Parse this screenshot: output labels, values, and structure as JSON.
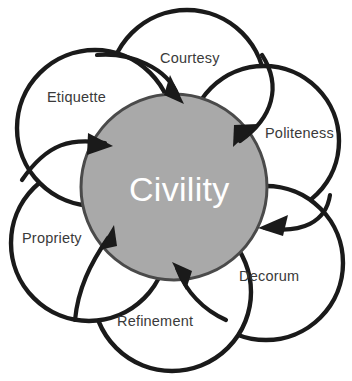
{
  "diagram": {
    "type": "petal-venn",
    "core": {
      "label": "Civility",
      "fill_color": "#a9a9a9",
      "stroke_color": "#4a4a4a",
      "text_color": "#ffffff",
      "center": [
        174,
        187
      ],
      "radius": 94
    },
    "petals": [
      {
        "id": "courtesy",
        "label": "Courtesy",
        "position": "top",
        "center": [
          187,
          88
        ],
        "radius": 78,
        "label_xy": [
          160,
          51
        ]
      },
      {
        "id": "politeness",
        "label": "Politeness",
        "position": "upper-right",
        "center": [
          264,
          141
        ],
        "radius": 75,
        "label_xy": [
          265,
          126
        ]
      },
      {
        "id": "decorum",
        "label": "Decorum",
        "position": "lower-right",
        "center": [
          266,
          263
        ],
        "radius": 77,
        "label_xy": [
          239,
          269
        ]
      },
      {
        "id": "refinement",
        "label": "Refinement",
        "position": "bottom",
        "center": [
          172,
          292
        ],
        "radius": 79,
        "label_xy": [
          117,
          314
        ]
      },
      {
        "id": "propriety",
        "label": "Propriety",
        "position": "lower-left",
        "center": [
          89,
          243
        ],
        "radius": 78,
        "label_xy": [
          22,
          231
        ]
      },
      {
        "id": "etiquette",
        "label": "Etiquette",
        "position": "upper-left",
        "center": [
          95,
          128
        ],
        "radius": 78,
        "label_xy": [
          47,
          90
        ]
      }
    ],
    "arrows": [
      {
        "id": "arrow-courtesy-to-core",
        "from": "courtesy",
        "to": "core"
      },
      {
        "id": "arrow-politeness-to-core",
        "from": "politeness",
        "to": "core"
      },
      {
        "id": "arrow-decorum-to-core",
        "from": "decorum",
        "to": "core"
      },
      {
        "id": "arrow-refinement-to-core",
        "from": "refinement",
        "to": "core"
      },
      {
        "id": "arrow-propriety-to-core",
        "from": "propriety",
        "to": "core"
      },
      {
        "id": "arrow-etiquette-to-core",
        "from": "etiquette",
        "to": "core"
      }
    ],
    "colors": {
      "background": "#ffffff",
      "outline": "#1a1a1a",
      "petal_fill": "#ffffff",
      "label_text": "#3a3a3a"
    }
  }
}
